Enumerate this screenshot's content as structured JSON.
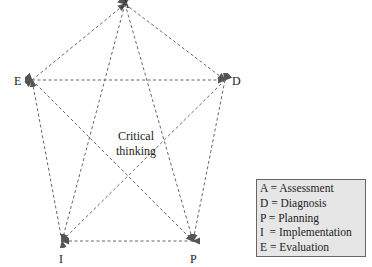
{
  "nodes": {
    "A": {
      "label": "A",
      "x": 125,
      "y": 4
    },
    "D": {
      "label": "D",
      "x": 225,
      "y": 80
    },
    "P": {
      "label": "P",
      "x": 193,
      "y": 241
    },
    "I": {
      "label": "I",
      "x": 62,
      "y": 241
    },
    "E": {
      "label": "E",
      "x": 32,
      "y": 80
    }
  },
  "center_label": {
    "line1": "Critical",
    "line2": "thinking"
  },
  "legend": [
    {
      "text": "A = Assessment"
    },
    {
      "text": "D = Diagnosis"
    },
    {
      "text": "P = Planning"
    },
    {
      "text": "I  = Implementation"
    },
    {
      "text": "E = Evaluation"
    }
  ],
  "colors": {
    "line": "#666666",
    "legend_bg": "#e6e6e6",
    "legend_border": "#666666"
  }
}
